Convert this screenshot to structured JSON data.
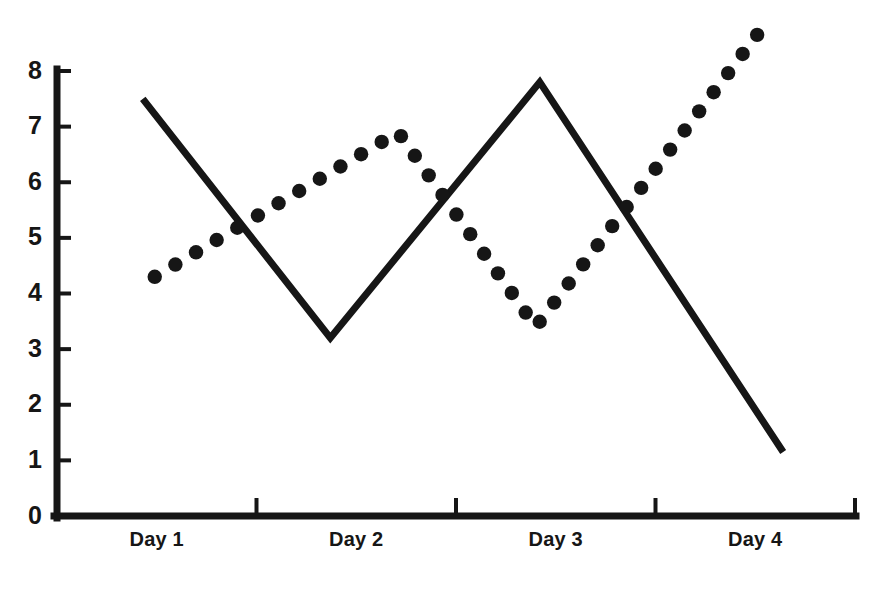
{
  "chart_data": {
    "type": "line",
    "title": "",
    "subtitle": "",
    "xlabel": "",
    "ylabel": "",
    "xlim": [
      0,
      4
    ],
    "ylim": [
      0,
      8
    ],
    "grid": false,
    "legend": "none",
    "categories": [
      "Day 1",
      "Day 2",
      "Day 3",
      "Day 4"
    ],
    "x_tick_labels": [
      "Day 1",
      "Day 2",
      "Day 3",
      "Day 4"
    ],
    "y_tick_labels": [
      "0",
      "1",
      "2",
      "3",
      "4",
      "5",
      "6",
      "7",
      "8"
    ],
    "y_tick_values": [
      0,
      1,
      2,
      3,
      4,
      5,
      6,
      7,
      8
    ],
    "x_tick_boundaries": [
      1,
      2,
      3,
      4
    ],
    "series": [
      {
        "name": "solid-line",
        "style": "solid",
        "color": "#161616",
        "x": [
          0.43,
          1.37,
          2.42,
          3.64
        ],
        "values": [
          7.5,
          3.2,
          7.8,
          1.15
        ]
      },
      {
        "name": "dotted-line",
        "style": "dotted",
        "color": "#161616",
        "x": [
          0.49,
          1.71,
          2.4,
          3.52
        ],
        "values": [
          4.3,
          6.9,
          3.4,
          8.7
        ]
      }
    ]
  },
  "axis": {
    "y_axis_name": "y-axis",
    "x_axis_name": "x-axis"
  }
}
